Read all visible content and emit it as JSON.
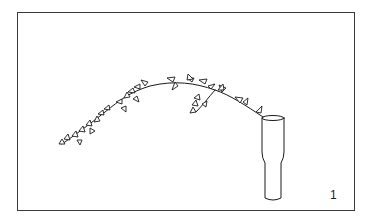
{
  "figure": {
    "number": "1",
    "style": "black-and-white line drawing",
    "colors": {
      "ink": "#1a1a1a",
      "background": "#ffffff",
      "frame": "#3a3a3a"
    }
  }
}
